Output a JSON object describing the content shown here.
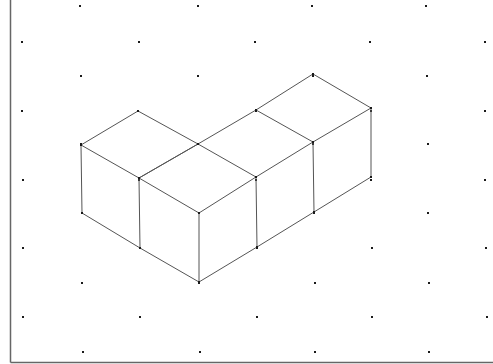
{
  "diagram": {
    "type": "isometric-dot-grid-drawing",
    "cube_count": 4,
    "colors": {
      "background": "#ffffff",
      "dot": "#1a1a1a",
      "edge": "#555555",
      "vertex": "#1a1a1a",
      "frame": "#666666"
    },
    "frame": {
      "left_x": 10.5,
      "bottom_y": 362.5,
      "right_x": 493
    },
    "dot_rows": [
      {
        "y": 6,
        "xs": [
          80,
          198,
          312,
          426
        ]
      },
      {
        "y": 42,
        "xs": [
          22,
          139,
          255,
          370,
          485
        ]
      },
      {
        "y": 76,
        "xs": [
          81,
          198,
          313,
          427
        ]
      },
      {
        "y": 111,
        "xs": [
          22,
          138,
          256,
          371,
          485
        ]
      },
      {
        "y": 144,
        "xs": [
          81,
          198,
          313,
          428
        ]
      },
      {
        "y": 180,
        "xs": [
          23,
          139,
          256,
          371,
          485
        ]
      },
      {
        "y": 213,
        "xs": [
          82,
          199,
          314,
          428
        ]
      },
      {
        "y": 248,
        "xs": [
          23,
          140,
          257,
          372,
          486
        ]
      },
      {
        "y": 283,
        "xs": [
          82,
          199,
          315,
          429
        ]
      },
      {
        "y": 317,
        "xs": [
          23,
          140,
          257,
          372,
          487
        ]
      },
      {
        "y": 352,
        "xs": [
          83,
          200,
          315,
          429
        ]
      }
    ],
    "vertices": {
      "A": [
        138,
        111
      ],
      "B": [
        81,
        145
      ],
      "C": [
        198,
        144
      ],
      "D": [
        139,
        178
      ],
      "E": [
        82,
        213
      ],
      "F": [
        140,
        248
      ],
      "G": [
        256,
        110
      ],
      "H": [
        313,
        74
      ],
      "I": [
        371,
        108
      ],
      "J": [
        313,
        142
      ],
      "K": [
        256,
        177
      ],
      "L": [
        199,
        213
      ],
      "M": [
        199,
        282
      ],
      "N": [
        257,
        247
      ],
      "O": [
        314,
        212
      ],
      "P": [
        371,
        177
      ]
    },
    "edges": [
      [
        "A",
        "B"
      ],
      [
        "A",
        "C"
      ],
      [
        "B",
        "D"
      ],
      [
        "C",
        "D"
      ],
      [
        "B",
        "E"
      ],
      [
        "E",
        "F"
      ],
      [
        "D",
        "F"
      ],
      [
        "D",
        "C"
      ],
      [
        "C",
        "G"
      ],
      [
        "G",
        "H"
      ],
      [
        "H",
        "I"
      ],
      [
        "G",
        "J"
      ],
      [
        "I",
        "J"
      ],
      [
        "C",
        "K"
      ],
      [
        "J",
        "K"
      ],
      [
        "D",
        "L"
      ],
      [
        "K",
        "L"
      ],
      [
        "L",
        "M"
      ],
      [
        "F",
        "M"
      ],
      [
        "M",
        "N"
      ],
      [
        "N",
        "O"
      ],
      [
        "O",
        "P"
      ],
      [
        "K",
        "N"
      ],
      [
        "J",
        "O"
      ],
      [
        "I",
        "P"
      ]
    ]
  }
}
